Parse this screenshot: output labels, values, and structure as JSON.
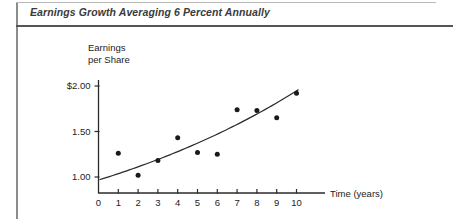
{
  "figure": {
    "caption": "Earnings Growth Averaging 6 Percent Annually"
  },
  "chart_data": {
    "type": "scatter",
    "title": "Earnings Growth Averaging 6 Percent Annually",
    "xlabel": "Time (years)",
    "ylabel": "Earnings per Share",
    "ylabel_line1": "Earnings",
    "ylabel_line2": "per Share",
    "grid": false,
    "legend": "none",
    "xlim": [
      0,
      10.6
    ],
    "ylim": [
      0.9,
      2.1
    ],
    "x": [
      1,
      2,
      3,
      4,
      5,
      6,
      7,
      8,
      9,
      10
    ],
    "values": [
      1.26,
      1.02,
      1.18,
      1.43,
      1.27,
      1.25,
      1.74,
      1.73,
      1.65,
      1.92
    ],
    "xticks": [
      0,
      1,
      2,
      3,
      4,
      5,
      6,
      7,
      8,
      9,
      10
    ],
    "xticklabels": [
      "0",
      "1",
      "2",
      "3",
      "4",
      "5",
      "6",
      "7",
      "8",
      "9",
      "10"
    ],
    "yticks": [
      1.0,
      1.5,
      2.0
    ],
    "yticklabels": [
      "1.00",
      "1.50",
      "$2.00"
    ],
    "trend": {
      "name": "6 percent annual growth curve",
      "style": "smooth-curve",
      "x_start": 0.05,
      "x_end": 10.1,
      "y_start": 0.97,
      "y_end": 1.96
    },
    "marker_color": "#1a1a1a",
    "line_color": "#2b2b2b",
    "axis_color": "#2b2b2b"
  }
}
